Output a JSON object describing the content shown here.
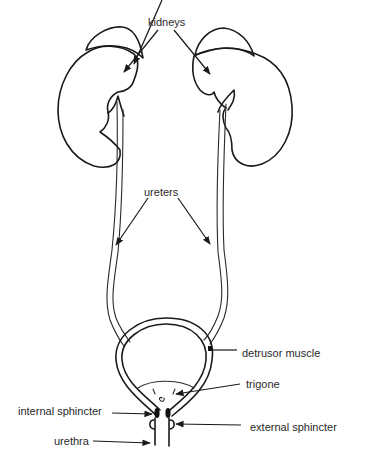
{
  "diagram": {
    "type": "anatomical-line-drawing",
    "colors": {
      "line": "#1a1a1a",
      "text": "#2a2a2a",
      "background": "#ffffff"
    },
    "labels": {
      "kidneys": "kidneys",
      "ureters": "ureters",
      "detrusor_muscle": "detrusor muscle",
      "trigone": "trigone",
      "internal_sphincter": "internal sphincter",
      "external_sphincter": "external sphincter",
      "urethra": "urethra"
    },
    "structures": [
      "left-kidney",
      "right-kidney",
      "left-adrenal-gland",
      "right-adrenal-gland",
      "left-ureter",
      "right-ureter",
      "bladder",
      "trigone",
      "internal-sphincter",
      "external-sphincter",
      "urethra"
    ]
  }
}
